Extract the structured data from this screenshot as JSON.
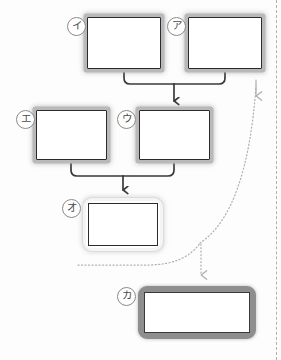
{
  "diagram": {
    "type": "flow-diagram",
    "title": "",
    "background_color": "#fdfdfd",
    "canvas": {
      "width": 281,
      "height": 360
    },
    "nodes": [
      {
        "id": "i",
        "tag": "イ",
        "tag_label": "circled-katakana-i",
        "style": "shadowed",
        "text": "",
        "x": 87,
        "y": 17,
        "w": 74,
        "h": 52
      },
      {
        "id": "a",
        "tag": "ア",
        "tag_label": "circled-katakana-a",
        "style": "shadowed",
        "text": "",
        "x": 188,
        "y": 17,
        "w": 74,
        "h": 52
      },
      {
        "id": "u",
        "tag": "ウ",
        "tag_label": "circled-katakana-u",
        "style": "shadowed",
        "text": "",
        "x": 139,
        "y": 110,
        "w": 71,
        "h": 50
      },
      {
        "id": "e",
        "tag": "エ",
        "tag_label": "circled-katakana-e",
        "style": "shadowed",
        "text": "",
        "x": 36,
        "y": 110,
        "w": 71,
        "h": 50
      },
      {
        "id": "o",
        "tag": "オ",
        "tag_label": "circled-katakana-o",
        "style": "framed",
        "text": "",
        "x": 83,
        "y": 198,
        "w": 80,
        "h": 53
      },
      {
        "id": "ka",
        "tag": "カ",
        "tag_label": "circled-katakana-ka",
        "style": "banded",
        "text": "",
        "x": 138,
        "y": 286,
        "w": 118,
        "h": 53
      }
    ],
    "connectors": [
      {
        "id": "i-to-u",
        "from": "i",
        "to": "u",
        "style": "solid",
        "arrow": true,
        "color": "#3a3a3a"
      },
      {
        "id": "a-to-u",
        "from": "a",
        "to": "u",
        "style": "solid",
        "arrow": true,
        "color": "#3a3a3a"
      },
      {
        "id": "e-to-o",
        "from": "e",
        "to": "o",
        "style": "solid",
        "arrow": true,
        "color": "#3a3a3a"
      },
      {
        "id": "u-to-o",
        "from": "u",
        "to": "o",
        "style": "solid",
        "arrow": true,
        "color": "#3a3a3a"
      },
      {
        "id": "o-to-ka",
        "from": "o",
        "to": "ka",
        "style": "dotted",
        "arrow": true,
        "color": "#b0b0b0"
      },
      {
        "id": "ka-to-a",
        "from": "ka",
        "to": "a",
        "style": "dotted",
        "arrow": true,
        "color": "#b0b0b0"
      }
    ],
    "page_rule": {
      "x": 276,
      "style": "dashed",
      "color": "#c2a8a8"
    }
  }
}
